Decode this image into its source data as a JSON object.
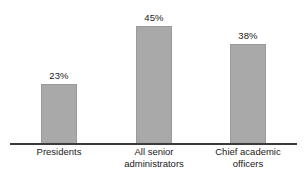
{
  "chart_data": {
    "type": "bar",
    "title": "",
    "subtitle": "",
    "xlabel": "",
    "ylabel": "",
    "ylim": [
      0,
      50
    ],
    "grid": false,
    "legend": false,
    "value_suffix": "%",
    "categories": [
      "Presidents",
      "All senior administrators",
      "Chief academic officers"
    ],
    "category_lines": [
      [
        "Presidents"
      ],
      [
        "All senior",
        "administrators"
      ],
      [
        "Chief academic",
        "officers"
      ]
    ],
    "values": [
      23,
      45,
      38
    ],
    "value_labels": [
      "23%",
      "45%",
      "38%"
    ],
    "bar_color": "#a9a9a9",
    "bar_border_color": "#9a9a9a",
    "axis_color": "#3a3a3a",
    "text_color": "#1a1a1a",
    "background": "#ffffff"
  }
}
